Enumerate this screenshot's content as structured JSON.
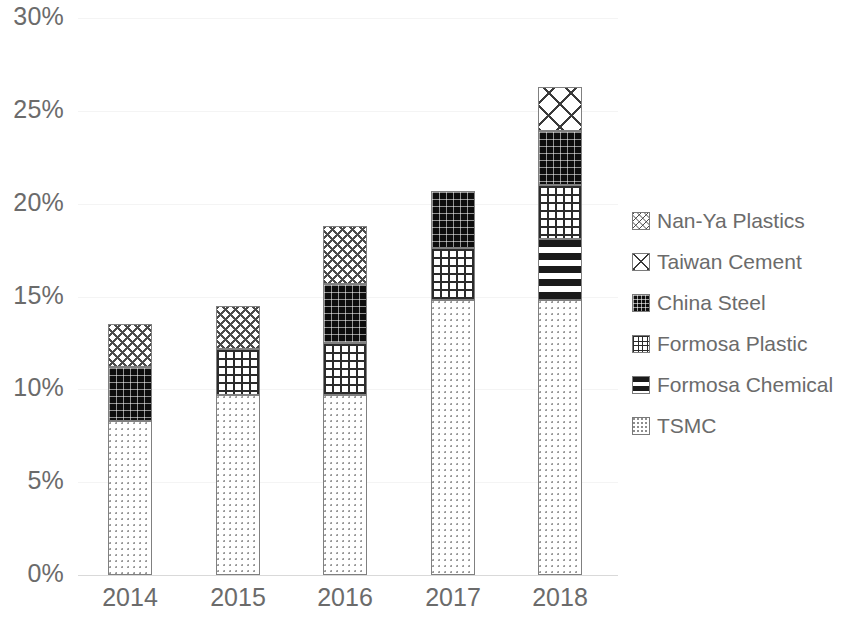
{
  "chart_data": {
    "type": "bar",
    "subtype": "stacked-column",
    "title": "",
    "subtitle": "",
    "xlabel": "",
    "ylabel": "",
    "categories": [
      "2014",
      "2015",
      "2016",
      "2017",
      "2018"
    ],
    "ylim": [
      0,
      30
    ],
    "ytick_values": [
      0,
      5,
      10,
      15,
      20,
      25,
      30
    ],
    "ytick_labels": [
      "0%",
      "5%",
      "10%",
      "15%",
      "20%",
      "25%",
      "30%"
    ],
    "yunit": "%",
    "grid": true,
    "legend_position": "right",
    "stack_order_bottom_to_top": [
      "TSMC",
      "Formosa Chemical",
      "Formosa Plastic",
      "China Steel",
      "Taiwan Cement",
      "Nan-Ya Plastics"
    ],
    "series": [
      {
        "name": "TSMC",
        "pattern": "light-dotted",
        "values": [
          8.3,
          9.7,
          9.7,
          14.8,
          14.8
        ]
      },
      {
        "name": "Formosa Chemical",
        "pattern": "vertical-dashes",
        "values": [
          0,
          0,
          0,
          0,
          3.3
        ]
      },
      {
        "name": "Formosa Plastic",
        "pattern": "square-grid",
        "values": [
          0,
          2.5,
          2.8,
          2.8,
          2.9
        ]
      },
      {
        "name": "China Steel",
        "pattern": "dark-dotted",
        "values": [
          2.9,
          0,
          3.2,
          3.1,
          2.9
        ]
      },
      {
        "name": "Taiwan Cement",
        "pattern": "diagonal-crosshatch",
        "values": [
          0,
          0,
          0,
          0,
          2.4
        ]
      },
      {
        "name": "Nan-Ya Plastics",
        "pattern": "zigzag-wave",
        "values": [
          2.3,
          2.3,
          3.1,
          0,
          0
        ]
      }
    ],
    "totals": [
      13.5,
      14.5,
      18.8,
      20.7,
      26.2
    ],
    "colors": {
      "axis_text": "#6b6b6b",
      "gridline": "#f4f4f4",
      "baseline": "#d9d9d9",
      "segment_outline": "#808080",
      "dark_fill": "#0d0d0d",
      "background": "#ffffff"
    }
  },
  "legend": {
    "items": [
      {
        "label": "Nan-Ya Plastics",
        "pattern_class": "pat-nanya-plastics"
      },
      {
        "label": "Taiwan Cement",
        "pattern_class": "pat-taiwan-cement"
      },
      {
        "label": "China Steel",
        "pattern_class": "pat-china-steel"
      },
      {
        "label": "Formosa Plastic",
        "pattern_class": "pat-formosa-plastic"
      },
      {
        "label": "Formosa Chemical",
        "pattern_class": "pat-formosa-chemical"
      },
      {
        "label": "TSMC",
        "pattern_class": "pat-tsmc"
      }
    ]
  }
}
